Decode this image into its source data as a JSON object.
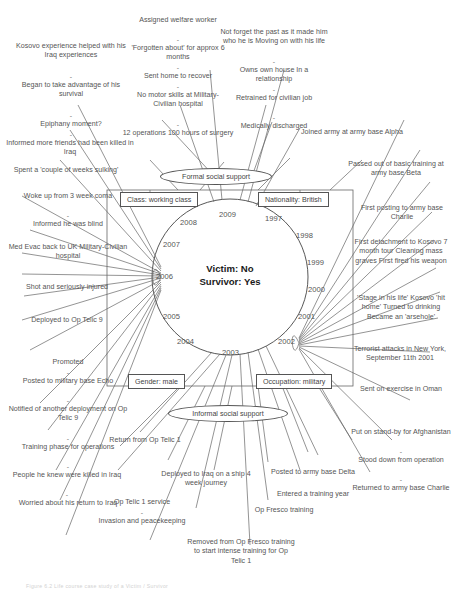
{
  "figure": {
    "caption": "Figure 6.2 Life course case study of a Victim / Survivor",
    "center": {
      "line1": "Victim: No",
      "line2": "Survivor: Yes"
    },
    "years": [
      "1997",
      "1998",
      "1999",
      "2000",
      "2001",
      "2002",
      "2003",
      "2004",
      "2005",
      "2006",
      "2007",
      "2008",
      "2009"
    ],
    "attribute_boxes": [
      {
        "name": "class-box",
        "label": "Class: working class"
      },
      {
        "name": "nationality-box",
        "label": "Nationality: British"
      },
      {
        "name": "gender-box",
        "label": "Gender: male"
      },
      {
        "name": "occupation-box",
        "label": "Occupation: military"
      }
    ],
    "support_ellipses": [
      {
        "name": "formal-social-support",
        "label": "Formal social support"
      },
      {
        "name": "informal-social-support",
        "label": "Informal social support"
      }
    ],
    "notes": {
      "kosovo_helped": "Kosovo experience helped with his Iraq experiences",
      "began_advantage": "Began to take advantage of his survival",
      "epiphany": "Epiphany moment?",
      "informed_friends_killed": "Informed more friends had been killed in Iraq",
      "weeks_sulking": "Spent a 'couple of weeks sulking'",
      "woke_coma": "Woke up from 3 week coma",
      "informed_blind": "Informed he was blind",
      "med_evac": "Med Evac back to UK Military-Civilian hospital",
      "shot_injured": "Shot and seriously injured",
      "deployed_telic9": "Deployed to Op Telic 9",
      "promoted": "Promoted",
      "posted_echo": "Posted to military base Echo",
      "notified_deployment": "Notified of another deployment on Op Telic 9",
      "training_phase": "Training phase for operations",
      "people_killed": "People he knew were killed in Iraq",
      "worried_return": "Worried about his return to Iraq",
      "assigned_welfare": "Assigned welfare worker",
      "forgotten_about": "'Forgotten about' for approx 6 months",
      "sent_home": "Sent home to recover",
      "no_motor_skills": "No motor skills at Military-Civilian hospital",
      "operations_surgery": "12 operations 100 hours of surgery",
      "not_forget_past": "Not forget the past as it made him who he is Moving on with his life",
      "owns_house": "Owns own house In a relationship",
      "retrained": "Retrained for civilian job",
      "medically_discharged": "Medically discharged",
      "joined_army": "Joined army at army base Alpha",
      "passed_basic": "Passed out of basic training at army base Beta",
      "first_posting": "First posting to army base Charlie",
      "first_detachment": "First detachment to Kosovo 7 month tour Cleaning mass graves First fired his weapon",
      "stage_in_life": "'Stage in his life' Kosovo 'hit home' Turned to drinking Became an 'arsehole'",
      "terrorist_attacks": "Terrorist attacks in New York, September 11th 2001",
      "sent_oman": "Sent on exercise in Oman",
      "standby_afghanistan": "Put on stand-by for Afghanistan",
      "stood_down": "Stood down from operation",
      "returned_charlie": "Returned to army base Charlie",
      "return_telic1": "Return from Op Telic 1",
      "deployed_ship": "Deployed to Iraq on a ship 4 week journey",
      "telic1_service": "Op Telic 1 service",
      "invasion_peacekeeping": "Invasion and peacekeeping",
      "removed_fresco": "Removed from Op Fresco training to start intense training for Op Telic 1",
      "fresco_training": "Op Fresco training",
      "posted_delta": "Posted to army base Delta",
      "entered_training_year": "Entered a training year"
    },
    "colors": {
      "ink": "#555555",
      "center_text": "#1b1b1b",
      "background": "#ffffff"
    }
  }
}
